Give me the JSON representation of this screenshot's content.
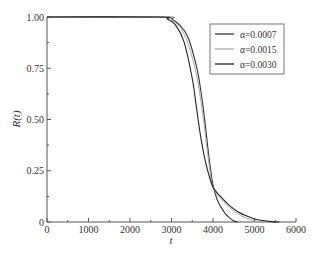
{
  "chart_data": {
    "type": "line",
    "title": "",
    "xlabel": "t",
    "ylabel": "R(t)",
    "xlim": [
      0,
      6000
    ],
    "ylim": [
      0,
      1.0
    ],
    "xticks": [
      0,
      1000,
      2000,
      3000,
      4000,
      5000,
      6000
    ],
    "xtick_labels": [
      "0",
      "1000",
      "2000",
      "3000",
      "4000",
      "5000",
      "6000"
    ],
    "yticks": [
      0,
      0.25,
      0.5,
      0.75,
      1.0
    ],
    "ytick_labels": [
      "0",
      "0.25",
      "0.50",
      "0.75",
      "1.00"
    ],
    "grid": false,
    "legend_position": "upper right",
    "series": [
      {
        "name": "α=0.0007",
        "color": "#333333",
        "x": [
          0,
          2800,
          3000,
          3200,
          3400,
          3600,
          3700,
          3800,
          3900,
          4000,
          4100,
          4200,
          4300,
          4400,
          4500,
          4600
        ],
        "y": [
          1.0,
          1.0,
          0.99,
          0.96,
          0.9,
          0.76,
          0.65,
          0.5,
          0.32,
          0.18,
          0.11,
          0.07,
          0.04,
          0.02,
          0.005,
          0.0
        ]
      },
      {
        "name": "α=0.0015",
        "color": "#aaaaaa",
        "x": [
          0,
          2800,
          3000,
          3200,
          3400,
          3600,
          3700,
          3800,
          3900,
          4000,
          4200,
          4400,
          4600,
          4800,
          5000,
          5200
        ],
        "y": [
          1.0,
          1.0,
          0.985,
          0.95,
          0.87,
          0.72,
          0.6,
          0.45,
          0.29,
          0.17,
          0.11,
          0.07,
          0.04,
          0.02,
          0.005,
          0.0
        ]
      },
      {
        "name": "α=0.0030",
        "color": "#222222",
        "x": [
          0,
          2700,
          2900,
          3100,
          3300,
          3500,
          3600,
          3700,
          3800,
          3900,
          4000,
          4200,
          4400,
          4600,
          4800,
          5000,
          5200,
          5400,
          5600
        ],
        "y": [
          1.0,
          1.0,
          0.99,
          0.96,
          0.88,
          0.7,
          0.56,
          0.42,
          0.31,
          0.23,
          0.17,
          0.12,
          0.08,
          0.05,
          0.03,
          0.015,
          0.007,
          0.002,
          0.0
        ]
      }
    ]
  },
  "legend": {
    "items": [
      {
        "label": "α=0.0007",
        "color": "#333333"
      },
      {
        "label": "α=0.0015",
        "color": "#aaaaaa"
      },
      {
        "label": "α=0.0030",
        "color": "#222222"
      }
    ]
  },
  "axes": {
    "xlabel": "t",
    "ylabel": "R(t)"
  }
}
